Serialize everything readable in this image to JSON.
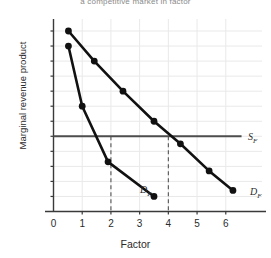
{
  "chart_data": {
    "type": "line",
    "title": "a competitive market in factor",
    "xlabel": "Factor",
    "ylabel": "Marginal revenue product",
    "xlim": [
      0,
      6.6
    ],
    "ylim": [
      0,
      126
    ],
    "grid": true,
    "x_ticks": [
      0,
      1,
      2,
      3,
      4,
      5,
      6
    ],
    "x_tick_labels": [
      "0",
      "1",
      "2",
      "3",
      "4",
      "5",
      "6"
    ],
    "y_ticks": [
      0,
      10,
      20,
      30,
      40,
      50,
      60,
      70,
      80,
      90,
      100,
      110,
      120
    ],
    "y_tick_labels": [
      "0",
      "10",
      "20",
      "30",
      "40",
      "50",
      "60",
      "70",
      "80",
      "90",
      "100",
      "110",
      "$120"
    ],
    "legend_position": "inline-right",
    "series": [
      {
        "name": "S_F",
        "label": "S",
        "label_sub": "F",
        "type": "horizontal-line",
        "style": "solid",
        "color": "#4d4d4d",
        "y_value": 50,
        "x_start": 0,
        "x_end": 6.55,
        "markers": false
      },
      {
        "name": "MRP-upper",
        "label": "D",
        "label_sub": "F",
        "type": "line",
        "style": "solid",
        "color": "#111111",
        "markers": true,
        "points": [
          {
            "x": 0.52,
            "y": 120
          },
          {
            "x": 1.42,
            "y": 100
          },
          {
            "x": 2.42,
            "y": 80
          },
          {
            "x": 3.5,
            "y": 60
          },
          {
            "x": 4.42,
            "y": 45
          },
          {
            "x": 5.42,
            "y": 27
          },
          {
            "x": 6.25,
            "y": 14
          }
        ]
      },
      {
        "name": "MRP-lower",
        "label": "D",
        "label_sub": "F",
        "type": "line",
        "style": "solid",
        "color": "#111111",
        "markers": true,
        "points": [
          {
            "x": 0.52,
            "y": 110
          },
          {
            "x": 1.0,
            "y": 70
          },
          {
            "x": 1.9,
            "y": 33
          },
          {
            "x": 3.5,
            "y": 10
          }
        ]
      }
    ],
    "annotations": [
      {
        "name": "equilibrium-drop-line-left",
        "type": "dashed-vertical",
        "x": 2,
        "y_from": 50,
        "y_to": 0,
        "color": "#555555"
      },
      {
        "name": "equilibrium-drop-line-right",
        "type": "dashed-vertical",
        "x": 4,
        "y_from": 50,
        "y_to": 0,
        "color": "#555555"
      }
    ]
  },
  "labels": {
    "supply_label": "S",
    "supply_sub": "F",
    "demand_lower_label": "D",
    "demand_lower_sub": "F",
    "demand_upper_label": "D",
    "demand_upper_sub": "F"
  }
}
